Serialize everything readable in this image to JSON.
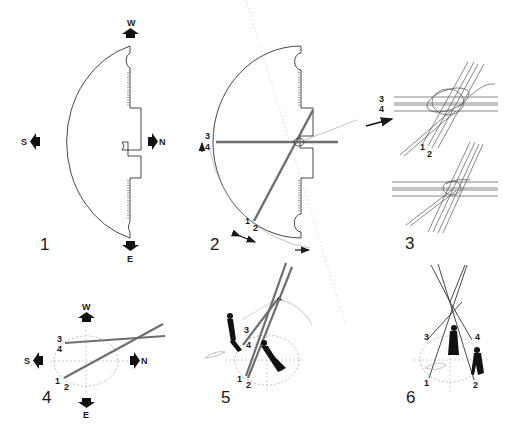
{
  "diagram": {
    "panels": [
      {
        "number": "1",
        "description": "Half-circle tipi cover laid flat with compass orientation",
        "directions": {
          "top": "W",
          "left": "S",
          "right": "N",
          "bottom": "E"
        }
      },
      {
        "number": "2",
        "description": "Poles laid on cover, measured and swung",
        "pole_labels": {
          "upper": "3",
          "lower_upper": "4",
          "bottom_a": "1",
          "bottom_b": "2"
        }
      },
      {
        "number": "3",
        "description": "Tying the tripod knot (detail)",
        "pole_labels": {
          "a": "3",
          "b": "4",
          "c": "1",
          "d": "2"
        }
      },
      {
        "number": "4",
        "description": "Poles positioned on ground circle",
        "directions": {
          "top": "W",
          "left": "S",
          "right": "N",
          "bottom": "E"
        },
        "pole_labels": {
          "a": "3",
          "b": "4",
          "c": "1",
          "d": "2"
        }
      },
      {
        "number": "5",
        "description": "Raising the tripod",
        "pole_labels": {
          "a": "3",
          "b": "4",
          "c": "1",
          "d": "2"
        }
      },
      {
        "number": "6",
        "description": "Spreading the tripod legs",
        "pole_labels": {
          "a": "3",
          "b": "4",
          "c": "1",
          "d": "2"
        }
      }
    ]
  },
  "colors": {
    "ink": "#1a1a1a",
    "pole": "#6e6e6e",
    "guide": "#9a9a9a"
  }
}
